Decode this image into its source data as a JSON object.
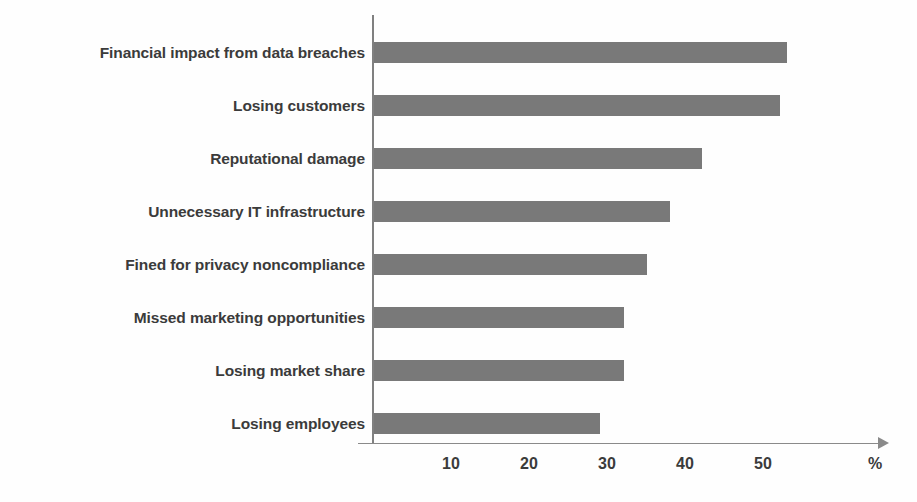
{
  "chart_data": {
    "type": "bar",
    "orientation": "horizontal",
    "title": "",
    "xlabel": "%",
    "ylabel": "",
    "categories": [
      "Financial impact from data breaches",
      "Losing customers",
      "Reputational damage",
      "Unnecessary IT infrastructure",
      "Fined for privacy noncompliance",
      "Missed marketing opportunities",
      "Losing market share",
      "Losing employees"
    ],
    "values": [
      53,
      52,
      42,
      38,
      35,
      32,
      32,
      29
    ],
    "xlim": [
      0,
      66
    ],
    "xticks": [
      10,
      20,
      30,
      40,
      50
    ],
    "xtick_labels": [
      "10",
      "20",
      "30",
      "40",
      "50"
    ],
    "grid": false,
    "legend": false,
    "bar_color": "#797979",
    "axis_color": "#8a8a8a",
    "label_color": "#3b3b3b"
  },
  "axis": {
    "unit_label": "%"
  }
}
